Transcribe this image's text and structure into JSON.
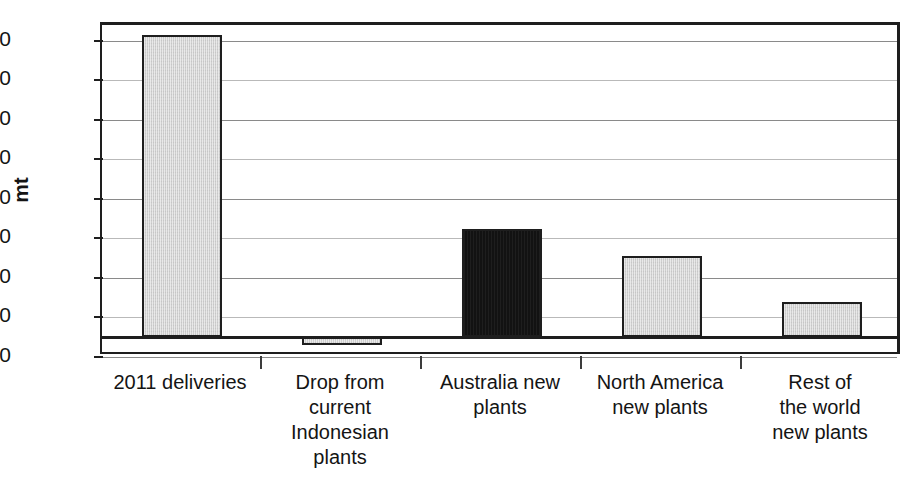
{
  "chart_data": {
    "type": "bar",
    "title": "",
    "subtitle": "",
    "xlabel": "",
    "ylabel": "mt",
    "ylim": [
      -10,
      158
    ],
    "yticks": [
      150,
      130,
      110,
      90,
      70,
      50,
      30,
      10,
      -10
    ],
    "ytick_labels": [
      "150",
      "130",
      "110",
      "90",
      "70",
      "50",
      "30",
      "10",
      "–10"
    ],
    "grid": true,
    "legend": null,
    "categories": [
      "2011 deliveries",
      "Drop from current Indonesian plants",
      "Australia new plants",
      "North America new plants",
      "Rest of the world new plants"
    ],
    "category_lines": [
      [
        "2011 deliveries"
      ],
      [
        "Drop from",
        "current",
        "Indonesian",
        "plants"
      ],
      [
        "Australia new",
        "plants"
      ],
      [
        "North America",
        "new plants"
      ],
      [
        "Rest of",
        "the world",
        "new plants"
      ]
    ],
    "values": [
      153,
      -4,
      55,
      41,
      18
    ],
    "bar_colors": [
      "#cfcfcf",
      "#cfcfcf",
      "#121212",
      "#cfcfcf",
      "#cfcfcf"
    ],
    "colors": {
      "light_bar": "#cfcfcf",
      "dark_bar": "#121212",
      "outline": "#1e1e1e",
      "gridline": "#8a8a8a",
      "background": "#ffffff",
      "text": "#141414"
    }
  }
}
